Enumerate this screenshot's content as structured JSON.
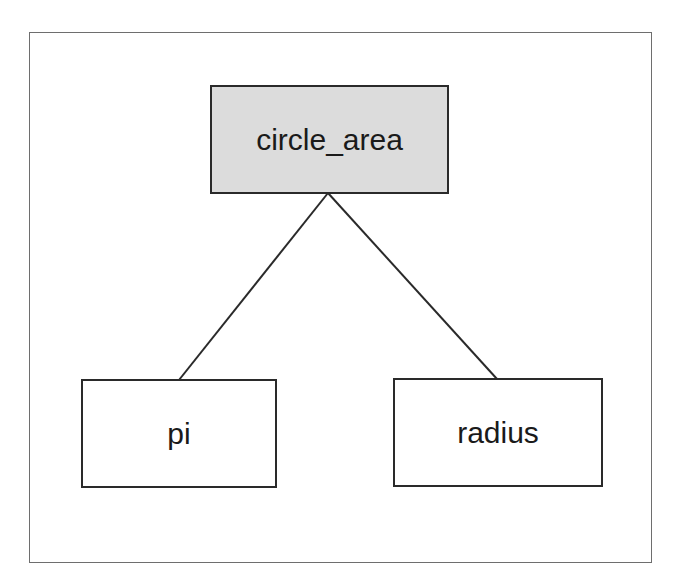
{
  "diagram": {
    "type": "tree",
    "colors": {
      "root_fill": "#dcdcdc",
      "leaf_fill": "#ffffff",
      "border": "#2a2a2a",
      "frame": "#6e6e6e"
    },
    "nodes": [
      {
        "id": "circle_area",
        "label": "circle_area",
        "role": "root"
      },
      {
        "id": "pi",
        "label": "pi",
        "role": "child"
      },
      {
        "id": "radius",
        "label": "radius",
        "role": "child"
      }
    ],
    "edges": [
      {
        "from": "circle_area",
        "to": "pi"
      },
      {
        "from": "circle_area",
        "to": "radius"
      }
    ]
  }
}
